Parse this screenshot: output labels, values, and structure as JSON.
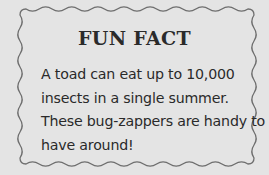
{
  "card": {
    "title": "FUN FACT",
    "lines": [
      "A toad can eat up to 10,000",
      "insects in a single summer.",
      "These bug-zappers are handy to",
      "have around!"
    ],
    "colors": {
      "background": "#e4e4e4",
      "border": "#6e6e6e",
      "text": "#2a2a2a"
    }
  }
}
